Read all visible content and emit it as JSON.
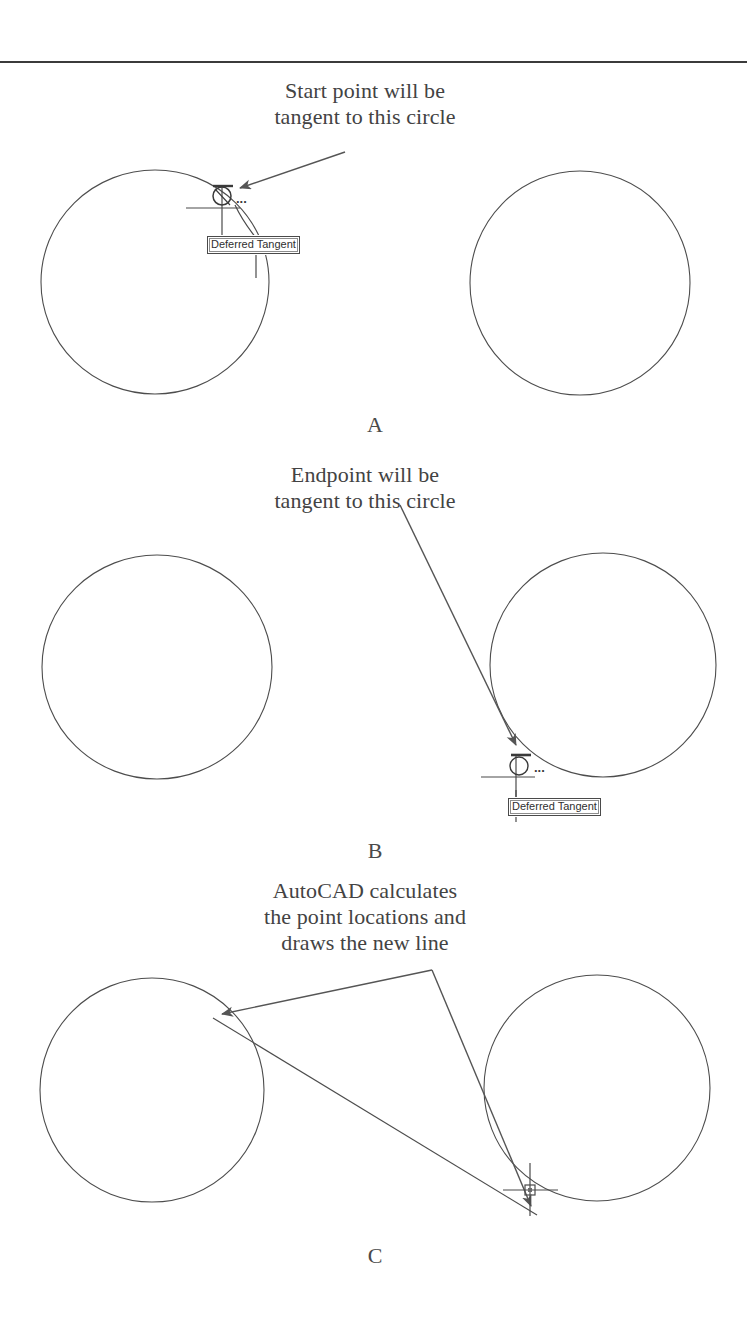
{
  "document": {
    "title": "Drawing Tangent Line Between Two Circles",
    "top_rule": true,
    "background_color": "#ffffff",
    "ink_color": "#3a3a3a"
  },
  "panels": [
    {
      "id": "A",
      "letter": "A",
      "caption": "Start point will be\ntangent to this circle",
      "tooltip": "Deferred Tangent",
      "ellipsis": "...",
      "circles": [
        {
          "name": "left-circle",
          "cx": 155,
          "cy": 282,
          "rx": 114,
          "ry": 112
        },
        {
          "name": "right-circle",
          "cx": 580,
          "cy": 283,
          "rx": 110,
          "ry": 112
        }
      ],
      "leader": {
        "from_x": 345,
        "from_y": 152,
        "to_x": 232,
        "to_y": 190
      },
      "cursor": {
        "x": 222,
        "y": 196
      },
      "osnap_marker": "deferred-tangent-marker"
    },
    {
      "id": "B",
      "letter": "B",
      "caption": "Endpoint will be\ntangent to this circle",
      "tooltip": "Deferred Tangent",
      "ellipsis": "...",
      "circles": [
        {
          "name": "left-circle",
          "cx": 157,
          "cy": 667,
          "rx": 115,
          "ry": 112
        },
        {
          "name": "right-circle",
          "cx": 603,
          "cy": 665,
          "rx": 113,
          "ry": 112
        }
      ],
      "leader": {
        "from_x": 400,
        "from_y": 505,
        "to_x": 520,
        "to_y": 752
      },
      "cursor": {
        "x": 516,
        "y": 766
      },
      "osnap_marker": "deferred-tangent-marker"
    },
    {
      "id": "C",
      "letter": "C",
      "caption": "AutoCAD calculates\nthe point locations and\ndraws the new line",
      "circles": [
        {
          "name": "left-circle",
          "cx": 152,
          "cy": 1090,
          "rx": 112,
          "ry": 112
        },
        {
          "name": "right-circle",
          "cx": 597,
          "cy": 1088,
          "rx": 113,
          "ry": 113
        }
      ],
      "tangent_line": {
        "x1": 213,
        "y1": 1018,
        "x2": 537,
        "y2": 1215
      },
      "leaders": [
        {
          "from_x": 432,
          "from_y": 970,
          "to_x": 214,
          "to_y": 1016
        },
        {
          "from_x": 432,
          "from_y": 970,
          "to_x": 534,
          "to_y": 1212
        }
      ],
      "cursor": {
        "x": 530,
        "y": 1190
      },
      "osnap_marker": "crosshair-pickbox"
    }
  ],
  "icons": {
    "deferred_tangent": "tangent-osnap-icon",
    "crosshair": "crosshair-cursor-icon",
    "arrow": "arrowhead-icon"
  }
}
